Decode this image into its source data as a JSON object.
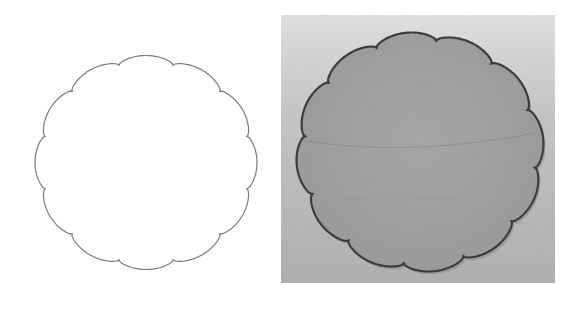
{
  "figure": {
    "width": 577,
    "height": 311,
    "background": "#ffffff",
    "caption": "Scalloped (12-lobe) outline shape beside a photograph of the corresponding physical scalloped piece"
  },
  "outline_shape": {
    "label": "scalloped-outline-drawing",
    "cx": 146,
    "cy": 162.5,
    "rx": 111,
    "ry": 107,
    "lobes": 12,
    "lobe_depth": 0.06,
    "rotation_deg": 15,
    "stroke": "#7a7a7a",
    "stroke_width": 1.2,
    "fill": "#ffffff"
  },
  "photo": {
    "label": "scalloped-piece-photo",
    "x": 281,
    "y": 15,
    "width": 274,
    "height": 268,
    "bg_top": "#e2e2e2",
    "bg_bottom": "#b2b2b2",
    "shape": {
      "cx": 420,
      "cy": 152,
      "rx": 124,
      "ry": 120,
      "lobes": 12,
      "lobe_depth": 0.065,
      "rotation_deg": 8,
      "fill": "#9c9c9c",
      "fill_light": "#a8a8a8",
      "edge": "#3e3e3e",
      "edge_width": 2.2
    }
  }
}
